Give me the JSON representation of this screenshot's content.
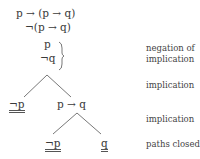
{
  "tree": {
    "root": "p → (p → q)",
    "negated_conclusion": "¬(p → q)",
    "bracket_formulas": [
      "p",
      "¬q"
    ],
    "level1_left": "¬p",
    "level1_right": "p → q",
    "level2_left": "¬p",
    "level2_right": "q"
  },
  "annotations": {
    "negation_line1": "negation of",
    "negation_line2": "implication",
    "implication_1": "implication",
    "implication_2": "implication",
    "paths_closed": "paths closed"
  }
}
